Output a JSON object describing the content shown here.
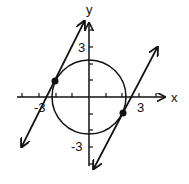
{
  "figure": {
    "type": "coordinate-plane",
    "axes": {
      "x_label": "x",
      "y_label": "y",
      "x_tick_labels": {
        "neg": "-3",
        "pos": "3"
      },
      "y_tick_labels": {
        "pos": "3",
        "neg": "-3"
      },
      "x_range": [
        -4,
        4
      ],
      "y_range": [
        -4,
        4
      ],
      "tick_spacing": 1
    },
    "circle": {
      "equation": "x^2 + y^2 = 5",
      "center": [
        0,
        0
      ],
      "radius": 2.236
    },
    "lines": [
      {
        "name": "left-tangent",
        "equation": "y = 2x + 5",
        "tangent_point": [
          -2,
          1
        ]
      },
      {
        "name": "right-tangent",
        "equation": "y = 2x - 5",
        "tangent_point": [
          2,
          -1
        ]
      }
    ],
    "points": [
      {
        "x": -2,
        "y": 1
      },
      {
        "x": 2,
        "y": -1
      }
    ],
    "colors": {
      "stroke": "#111111",
      "background": "#ffffff"
    }
  }
}
